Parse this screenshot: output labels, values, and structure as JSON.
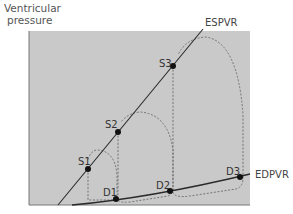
{
  "diagram": {
    "y_axis_label_line1": "Ventricular",
    "y_axis_label_line2": "pressure",
    "colors": {
      "panel": "#c9c9c9",
      "line": "#2a2a2a",
      "dashed": "#6a6a6a",
      "point": "#111111"
    },
    "curves": [
      {
        "id": "espvr",
        "label": "ESPVR",
        "type": "line"
      },
      {
        "id": "edpvr",
        "label": "EDPVR",
        "type": "curve"
      }
    ],
    "points": [
      {
        "label": "S1",
        "on": "ESPVR"
      },
      {
        "label": "S2",
        "on": "ESPVR"
      },
      {
        "label": "S3",
        "on": "ESPVR"
      },
      {
        "label": "D1",
        "on": "EDPVR"
      },
      {
        "label": "D2",
        "on": "EDPVR"
      },
      {
        "label": "D3",
        "on": "EDPVR"
      }
    ],
    "loops": [
      {
        "name": "loop-1",
        "from": "D1",
        "to": "S1"
      },
      {
        "name": "loop-2",
        "from": "D2",
        "to": "S2"
      },
      {
        "name": "loop-3",
        "from": "D3",
        "to": "S3"
      }
    ]
  }
}
